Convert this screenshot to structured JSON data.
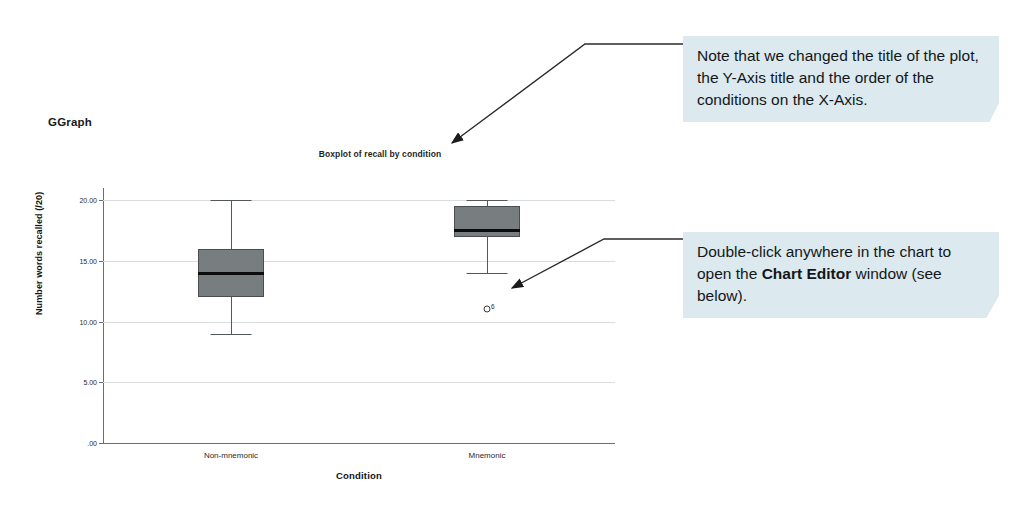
{
  "section_label": "GGraph",
  "chart_data": {
    "type": "boxplot",
    "title": "Boxplot of recall by condition",
    "xlabel": "Condition",
    "ylabel": "Number words recalled (/20)",
    "categories": [
      "Non-mnemonic",
      "Mnemonic"
    ],
    "ylim": [
      0,
      21
    ],
    "yticks": [
      0,
      5,
      10,
      15,
      20
    ],
    "ytick_labels": [
      ".00",
      "5.00",
      "10.00",
      "15.00",
      "20.00"
    ],
    "grid": true,
    "legend": "none",
    "boxes": [
      {
        "category": "Non-mnemonic",
        "whisker_low": 9,
        "q1": 12,
        "median": 14,
        "q3": 16,
        "whisker_high": 20,
        "outliers": []
      },
      {
        "category": "Mnemonic",
        "whisker_low": 14,
        "q1": 17,
        "median": 17.5,
        "q3": 19.5,
        "whisker_high": 20,
        "outliers": [
          {
            "value": 11,
            "label": "6"
          }
        ]
      }
    ]
  },
  "callouts": [
    {
      "id": "callout-title-note",
      "text_parts": [
        {
          "text": "Note that we changed the title of the plot, the Y-Axis title and the order of the conditions on the X-Axis.",
          "bold": false
        }
      ]
    },
    {
      "id": "callout-chart-editor",
      "text_parts": [
        {
          "text": "Double-click anywhere in the chart to open the ",
          "bold": false
        },
        {
          "text": "Chart Editor",
          "bold": true
        },
        {
          "text": " window (see below).",
          "bold": false
        }
      ]
    }
  ],
  "colors": {
    "callout_background": "#dce9ef",
    "box_fill": "#787d80",
    "median": "#0c0c0c",
    "gridline": "#d9dde0",
    "axis": "#6d6d6d",
    "text": "#13171a"
  }
}
